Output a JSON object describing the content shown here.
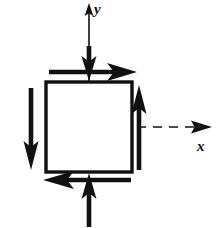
{
  "figure": {
    "kind": "stress-element-diagram",
    "title": "",
    "background_color": "#ffffff",
    "ink_color": "#111111",
    "canvas": {
      "width": 223,
      "height": 228
    },
    "axes": {
      "x": {
        "label": "x",
        "label_position": {
          "x": 201,
          "y": 146
        },
        "line_style": "dashed",
        "from": {
          "x": 89,
          "y": 127
        },
        "to": {
          "x": 212,
          "y": 127
        },
        "arrowhead": "right"
      },
      "y": {
        "label": "y",
        "label_position": {
          "x": 98,
          "y": 12
        },
        "line_style": "solid-thin",
        "from": {
          "x": 89,
          "y": 127
        },
        "to": {
          "x": 89,
          "y": 4
        },
        "arrowhead": "up"
      },
      "origin": {
        "x": 89,
        "y": 127
      }
    },
    "element": {
      "shape": "square",
      "left": 46,
      "top": 82,
      "right": 132,
      "bottom": 172,
      "stroke_width": 3.2,
      "fill": "#ffffff"
    },
    "interior_dashes": {
      "vertical": {
        "x": 89,
        "from_y": 96,
        "to_y": 127
      },
      "horizontal": {
        "y": 127,
        "from_x": 89,
        "to_x": 132
      }
    },
    "arrows": [
      {
        "id": "top-shear-right",
        "name": "top-edge-shear-arrow-right",
        "direction": "right",
        "from": {
          "x": 49,
          "y": 72
        },
        "to": {
          "x": 136,
          "y": 72
        },
        "weight": "heavy"
      },
      {
        "id": "bottom-shear-left",
        "name": "bottom-edge-shear-arrow-left",
        "direction": "left",
        "from": {
          "x": 131,
          "y": 180
        },
        "to": {
          "x": 44,
          "y": 180
        },
        "weight": "heavy"
      },
      {
        "id": "left-shear-down",
        "name": "left-edge-shear-arrow-down",
        "direction": "down",
        "from": {
          "x": 31,
          "y": 88
        },
        "to": {
          "x": 31,
          "y": 168
        },
        "weight": "heavy"
      },
      {
        "id": "right-shear-up",
        "name": "right-edge-shear-arrow-up",
        "direction": "up",
        "from": {
          "x": 139,
          "y": 170
        },
        "to": {
          "x": 139,
          "y": 86
        },
        "weight": "heavy"
      },
      {
        "id": "top-normal-down",
        "name": "top-normal-compression-arrow-down",
        "direction": "down",
        "from": {
          "x": 89,
          "y": 48
        },
        "to": {
          "x": 89,
          "y": 80
        },
        "weight": "heavy"
      },
      {
        "id": "bottom-normal-up",
        "name": "bottom-normal-compression-arrow-up",
        "direction": "up",
        "from": {
          "x": 89,
          "y": 226
        },
        "to": {
          "x": 89,
          "y": 174
        },
        "weight": "heavy"
      }
    ]
  }
}
